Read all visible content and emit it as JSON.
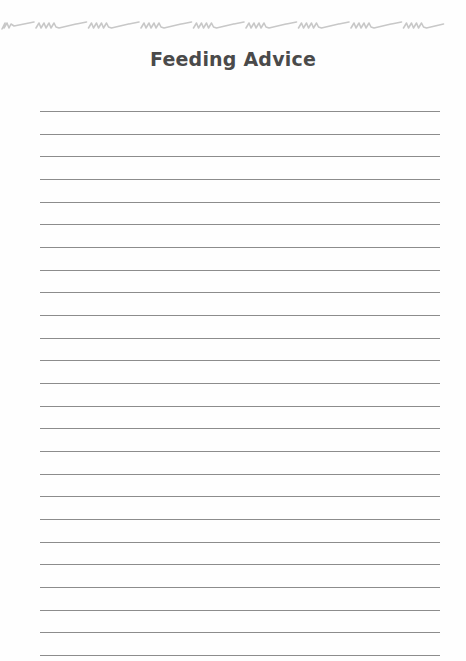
{
  "page": {
    "title": "Feeding Advice",
    "decoration": "handwriting-squiggle-border",
    "writing_lines_count": 25,
    "colors": {
      "title": "#4a4a4a",
      "rule": "#8c8c8c",
      "squiggle": "#c8c8c8"
    }
  }
}
